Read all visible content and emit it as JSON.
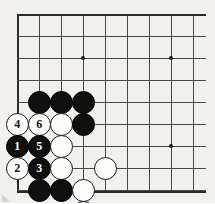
{
  "diagram": {
    "type": "go-board-problem",
    "board": {
      "origin_x": 17,
      "origin_y": 14,
      "spacing": 22,
      "cols": 9,
      "rows": 8,
      "line_color": "#4a4a48",
      "edge_color": "#2a2a28",
      "background_color": "#f2f1ee"
    },
    "star_points": [
      {
        "col": 4,
        "row": 3
      },
      {
        "col": 8,
        "row": 3
      },
      {
        "col": 8,
        "row": 7
      }
    ],
    "stones": [
      {
        "col": 2,
        "row": 5,
        "color": "black",
        "label": ""
      },
      {
        "col": 3,
        "row": 5,
        "color": "black",
        "label": ""
      },
      {
        "col": 4,
        "row": 5,
        "color": "black",
        "label": ""
      },
      {
        "col": 1,
        "row": 6,
        "color": "white",
        "label": "4"
      },
      {
        "col": 2,
        "row": 6,
        "color": "white",
        "label": "6"
      },
      {
        "col": 3,
        "row": 6,
        "color": "white",
        "label": ""
      },
      {
        "col": 4,
        "row": 6,
        "color": "black",
        "label": ""
      },
      {
        "col": 1,
        "row": 7,
        "color": "black",
        "label": "1"
      },
      {
        "col": 2,
        "row": 7,
        "color": "black",
        "label": "5"
      },
      {
        "col": 3,
        "row": 7,
        "color": "white",
        "label": ""
      },
      {
        "col": 1,
        "row": 8,
        "color": "white",
        "label": "2"
      },
      {
        "col": 2,
        "row": 8,
        "color": "black",
        "label": "3"
      },
      {
        "col": 3,
        "row": 8,
        "color": "white",
        "label": ""
      },
      {
        "col": 5,
        "row": 8,
        "color": "white",
        "label": ""
      },
      {
        "col": 2,
        "row": 9,
        "color": "black",
        "label": ""
      },
      {
        "col": 3,
        "row": 9,
        "color": "black",
        "label": ""
      },
      {
        "col": 4,
        "row": 9,
        "color": "white",
        "label": ""
      },
      {
        "col": 4,
        "row": 10,
        "color": "white",
        "label": ""
      }
    ],
    "markers": [
      {
        "col": 1,
        "row": 10,
        "label": "B"
      },
      {
        "col": 3,
        "row": 10,
        "label": "A"
      }
    ],
    "move_sequence": [
      {
        "number": "1",
        "color": "black"
      },
      {
        "number": "2",
        "color": "white"
      },
      {
        "number": "3",
        "color": "black"
      },
      {
        "number": "4",
        "color": "white"
      },
      {
        "number": "5",
        "color": "black"
      },
      {
        "number": "6",
        "color": "white"
      }
    ]
  }
}
